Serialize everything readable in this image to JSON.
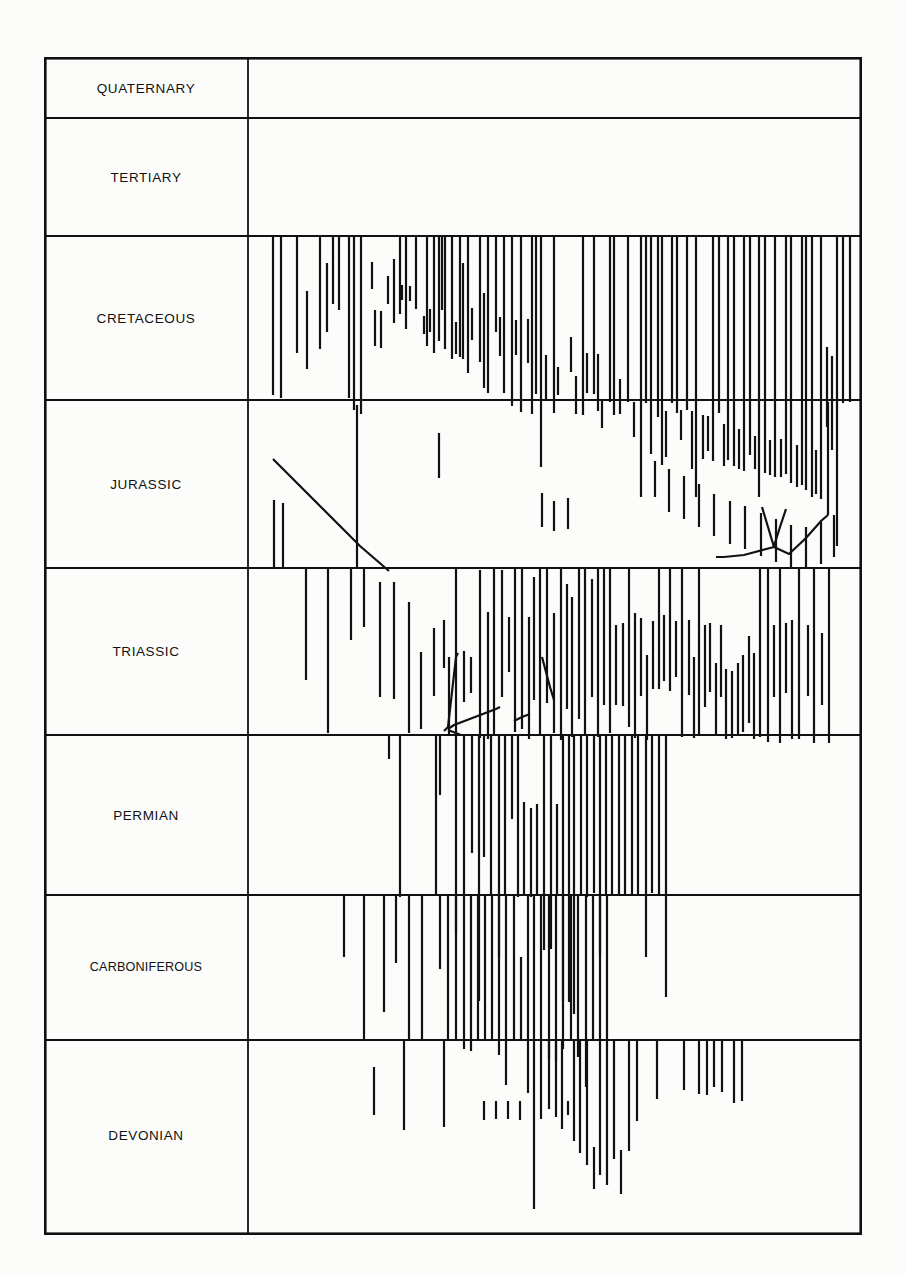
{
  "document": {
    "kind": "stratigraphic-range-chart",
    "orientation": "time-down"
  },
  "frame": {
    "x": 44,
    "y": 57,
    "width": 818,
    "height": 1178,
    "label_column_width": 204,
    "border_color": "#111111",
    "border_width": 2.6,
    "rule_width": 1.8,
    "bar_color": "#111111",
    "bar_width": 2.2,
    "background": "#fcfcfb"
  },
  "periods": [
    {
      "name": "QUATERNARY",
      "top": 0,
      "bottom": 61,
      "label_y": 30.5
    },
    {
      "name": "TERTIARY",
      "top": 61,
      "bottom": 179,
      "label_y": 120
    },
    {
      "name": "CRETACEOUS",
      "top": 179,
      "bottom": 343,
      "label_y": 261
    },
    {
      "name": "JURASSIC",
      "top": 343,
      "bottom": 511,
      "label_y": 427
    },
    {
      "name": "TRIASSIC",
      "top": 511,
      "bottom": 678,
      "label_y": 594
    },
    {
      "name": "PERMIAN",
      "top": 678,
      "bottom": 838,
      "label_y": 758
    },
    {
      "name": "CARBONIFEROUS",
      "top": 838,
      "bottom": 983,
      "label_y": 910
    },
    {
      "name": "DEVONIAN",
      "top": 983,
      "bottom": 1178,
      "label_y": 1078
    }
  ],
  "chart_data": {
    "type": "range-bars",
    "title": "",
    "xlabel": "",
    "ylabel": "",
    "axis_note": "vertical axis = geologic period (Quaternary at top, Devonian at bottom); horizontal axis = unlabelled taxon ordering",
    "grid": true,
    "legend": "none",
    "bar_count": 248,
    "bars": [
      [
        229,
        179,
        338
      ],
      [
        237,
        179,
        341
      ],
      [
        253,
        179,
        296
      ],
      [
        263,
        234,
        312
      ],
      [
        276,
        179,
        292
      ],
      [
        283,
        206,
        275
      ],
      [
        289,
        179,
        247
      ],
      [
        295,
        179,
        253
      ],
      [
        305,
        179,
        341
      ],
      [
        310,
        179,
        353
      ],
      [
        317,
        179,
        357
      ],
      [
        328,
        205,
        232
      ],
      [
        331,
        253,
        289
      ],
      [
        337,
        254,
        291
      ],
      [
        344,
        219,
        247
      ],
      [
        350,
        202,
        266
      ],
      [
        356,
        179,
        257
      ],
      [
        358,
        228,
        243
      ],
      [
        362,
        179,
        272
      ],
      [
        366,
        229,
        244
      ],
      [
        372,
        179,
        252
      ],
      [
        380,
        259,
        277
      ],
      [
        383,
        179,
        289
      ],
      [
        386,
        252,
        275
      ],
      [
        390,
        179,
        296
      ],
      [
        395,
        179,
        284
      ],
      [
        398,
        179,
        253
      ],
      [
        401,
        179,
        292
      ],
      [
        408,
        179,
        302
      ],
      [
        412,
        265,
        297
      ],
      [
        416,
        179,
        300
      ],
      [
        419,
        206,
        302
      ],
      [
        424,
        179,
        316
      ],
      [
        428,
        251,
        283
      ],
      [
        436,
        179,
        305
      ],
      [
        440,
        236,
        331
      ],
      [
        444,
        179,
        336
      ],
      [
        452,
        179,
        275
      ],
      [
        456,
        260,
        299
      ],
      [
        460,
        179,
        336
      ],
      [
        468,
        179,
        349
      ],
      [
        472,
        263,
        298
      ],
      [
        477,
        179,
        355
      ],
      [
        484,
        262,
        306
      ],
      [
        488,
        179,
        357
      ],
      [
        492,
        179,
        337
      ],
      [
        497,
        179,
        410
      ],
      [
        502,
        298,
        344
      ],
      [
        510,
        179,
        356
      ],
      [
        514,
        310,
        338
      ],
      [
        527,
        280,
        315
      ],
      [
        532,
        319,
        357
      ],
      [
        539,
        179,
        358
      ],
      [
        543,
        296,
        336
      ],
      [
        550,
        179,
        337
      ],
      [
        554,
        297,
        354
      ],
      [
        558,
        343,
        371
      ],
      [
        566,
        179,
        345
      ],
      [
        570,
        179,
        358
      ],
      [
        576,
        322,
        357
      ],
      [
        584,
        179,
        345
      ],
      [
        590,
        345,
        380
      ],
      [
        597,
        179,
        440
      ],
      [
        602,
        179,
        346
      ],
      [
        607,
        179,
        397
      ],
      [
        614,
        179,
        360
      ],
      [
        618,
        179,
        408
      ],
      [
        622,
        354,
        400
      ],
      [
        628,
        179,
        346
      ],
      [
        633,
        179,
        356
      ],
      [
        637,
        353,
        383
      ],
      [
        643,
        179,
        353
      ],
      [
        648,
        354,
        412
      ],
      [
        652,
        179,
        440
      ],
      [
        659,
        358,
        402
      ],
      [
        664,
        359,
        394
      ],
      [
        669,
        179,
        404
      ],
      [
        675,
        179,
        356
      ],
      [
        680,
        367,
        409
      ],
      [
        684,
        179,
        403
      ],
      [
        690,
        179,
        409
      ],
      [
        695,
        372,
        412
      ],
      [
        700,
        179,
        414
      ],
      [
        706,
        179,
        398
      ],
      [
        711,
        379,
        412
      ],
      [
        715,
        179,
        440
      ],
      [
        721,
        179,
        416
      ],
      [
        726,
        383,
        418
      ],
      [
        731,
        179,
        420
      ],
      [
        737,
        382,
        420
      ],
      [
        742,
        179,
        417
      ],
      [
        747,
        179,
        426
      ],
      [
        753,
        388,
        430
      ],
      [
        758,
        179,
        428
      ],
      [
        762,
        179,
        433
      ],
      [
        768,
        179,
        440
      ],
      [
        772,
        393,
        437
      ],
      [
        777,
        179,
        442
      ],
      [
        783,
        290,
        370
      ],
      [
        788,
        299,
        393
      ],
      [
        793,
        179,
        489
      ],
      [
        799,
        179,
        346
      ],
      [
        806,
        179,
        345
      ],
      [
        611,
        404,
        440
      ],
      [
        625,
        412,
        455
      ],
      [
        640,
        419,
        462
      ],
      [
        655,
        427,
        470
      ],
      [
        670,
        437,
        479
      ],
      [
        686,
        444,
        487
      ],
      [
        701,
        449,
        492
      ],
      [
        717,
        456,
        499
      ],
      [
        732,
        462,
        505
      ],
      [
        747,
        468,
        510
      ],
      [
        762,
        470,
        512
      ],
      [
        777,
        465,
        507
      ],
      [
        790,
        458,
        500
      ],
      [
        498,
        436,
        470
      ],
      [
        510,
        444,
        474
      ],
      [
        524,
        441,
        472
      ],
      [
        230,
        443,
        511
      ],
      [
        239,
        446,
        511
      ],
      [
        313,
        348,
        511
      ],
      [
        395,
        376,
        421
      ],
      [
        262,
        511,
        623
      ],
      [
        284,
        511,
        676
      ],
      [
        307,
        511,
        583
      ],
      [
        320,
        511,
        570
      ],
      [
        336,
        525,
        640
      ],
      [
        350,
        525,
        642
      ],
      [
        365,
        545,
        676
      ],
      [
        377,
        595,
        672
      ],
      [
        390,
        571,
        639
      ],
      [
        400,
        563,
        611
      ],
      [
        405,
        600,
        678
      ],
      [
        412,
        512,
        678
      ],
      [
        420,
        594,
        645
      ],
      [
        427,
        600,
        636
      ],
      [
        436,
        513,
        681
      ],
      [
        444,
        555,
        682
      ],
      [
        450,
        512,
        678
      ],
      [
        458,
        513,
        640
      ],
      [
        465,
        560,
        615
      ],
      [
        471,
        512,
        675
      ],
      [
        478,
        512,
        672
      ],
      [
        485,
        560,
        682
      ],
      [
        490,
        520,
        643
      ],
      [
        496,
        512,
        678
      ],
      [
        503,
        512,
        646
      ],
      [
        510,
        556,
        676
      ],
      [
        517,
        512,
        683
      ],
      [
        523,
        527,
        652
      ],
      [
        528,
        540,
        680
      ],
      [
        535,
        512,
        662
      ],
      [
        541,
        512,
        677
      ],
      [
        548,
        522,
        640
      ],
      [
        554,
        512,
        680
      ],
      [
        560,
        512,
        648
      ],
      [
        566,
        512,
        676
      ],
      [
        572,
        568,
        648
      ],
      [
        579,
        566,
        649
      ],
      [
        585,
        512,
        670
      ],
      [
        591,
        556,
        681
      ],
      [
        597,
        561,
        639
      ],
      [
        603,
        598,
        683
      ],
      [
        609,
        564,
        632
      ],
      [
        615,
        512,
        632
      ],
      [
        620,
        558,
        624
      ],
      [
        626,
        512,
        634
      ],
      [
        632,
        564,
        620
      ],
      [
        638,
        512,
        680
      ],
      [
        645,
        563,
        638
      ],
      [
        650,
        600,
        681
      ],
      [
        655,
        512,
        679
      ],
      [
        661,
        568,
        650
      ],
      [
        666,
        566,
        635
      ],
      [
        672,
        606,
        678
      ],
      [
        677,
        568,
        640
      ],
      [
        682,
        612,
        682
      ],
      [
        688,
        614,
        681
      ],
      [
        694,
        606,
        678
      ],
      [
        699,
        598,
        675
      ],
      [
        705,
        579,
        666
      ],
      [
        710,
        596,
        682
      ],
      [
        716,
        512,
        680
      ],
      [
        724,
        512,
        685
      ],
      [
        730,
        568,
        640
      ],
      [
        736,
        512,
        686
      ],
      [
        742,
        566,
        636
      ],
      [
        748,
        563,
        682
      ],
      [
        755,
        512,
        682
      ],
      [
        764,
        568,
        639
      ],
      [
        770,
        512,
        686
      ],
      [
        778,
        576,
        648
      ],
      [
        785,
        512,
        686
      ],
      [
        345,
        679,
        702
      ],
      [
        356,
        678,
        840
      ],
      [
        392,
        678,
        838
      ],
      [
        396,
        678,
        738
      ],
      [
        412,
        678,
        876
      ],
      [
        420,
        679,
        838
      ],
      [
        428,
        678,
        796
      ],
      [
        435,
        678,
        944
      ],
      [
        440,
        678,
        800
      ],
      [
        447,
        678,
        838
      ],
      [
        455,
        679,
        900
      ],
      [
        461,
        679,
        838
      ],
      [
        468,
        678,
        762
      ],
      [
        474,
        678,
        840
      ],
      [
        480,
        745,
        838
      ],
      [
        487,
        751,
        840
      ],
      [
        493,
        747,
        838
      ],
      [
        500,
        677,
        893
      ],
      [
        507,
        678,
        892
      ],
      [
        513,
        747,
        838
      ],
      [
        519,
        677,
        944
      ],
      [
        525,
        678,
        945
      ],
      [
        530,
        679,
        957
      ],
      [
        537,
        677,
        838
      ],
      [
        543,
        677,
        840
      ],
      [
        550,
        678,
        836
      ],
      [
        556,
        679,
        898
      ],
      [
        562,
        678,
        838
      ],
      [
        568,
        677,
        838
      ],
      [
        575,
        678,
        839
      ],
      [
        581,
        677,
        838
      ],
      [
        588,
        678,
        838
      ],
      [
        594,
        677,
        839
      ],
      [
        602,
        677,
        900
      ],
      [
        608,
        678,
        836
      ],
      [
        615,
        678,
        839
      ],
      [
        622,
        678,
        940
      ],
      [
        300,
        838,
        900
      ],
      [
        320,
        838,
        983
      ],
      [
        340,
        838,
        955
      ],
      [
        352,
        838,
        906
      ],
      [
        365,
        838,
        983
      ],
      [
        378,
        838,
        983
      ],
      [
        396,
        838,
        912
      ],
      [
        404,
        838,
        983
      ],
      [
        412,
        838,
        983
      ],
      [
        420,
        838,
        992
      ],
      [
        427,
        838,
        994
      ],
      [
        434,
        838,
        983
      ],
      [
        441,
        838,
        983
      ],
      [
        448,
        838,
        983
      ],
      [
        455,
        838,
        998
      ],
      [
        462,
        838,
        1028
      ],
      [
        470,
        838,
        983
      ],
      [
        477,
        900,
        983
      ],
      [
        484,
        838,
        1036
      ],
      [
        490,
        838,
        983
      ],
      [
        497,
        838,
        1062
      ],
      [
        505,
        838,
        1002
      ],
      [
        512,
        838,
        1004
      ],
      [
        519,
        838,
        992
      ],
      [
        527,
        838,
        983
      ],
      [
        534,
        838,
        1000
      ],
      [
        542,
        838,
        1030
      ],
      [
        549,
        838,
        983
      ],
      [
        556,
        838,
        983
      ],
      [
        563,
        838,
        983
      ],
      [
        330,
        1010,
        1058
      ],
      [
        360,
        983,
        1073
      ],
      [
        400,
        983,
        1070
      ],
      [
        440,
        1044,
        1063
      ],
      [
        452,
        1044,
        1062
      ],
      [
        464,
        1044,
        1062
      ],
      [
        476,
        1044,
        1063
      ],
      [
        490,
        983,
        1152
      ],
      [
        505,
        983,
        1052
      ],
      [
        512,
        983,
        1060
      ],
      [
        518,
        983,
        1072
      ],
      [
        524,
        1044,
        1058
      ],
      [
        530,
        983,
        1084
      ],
      [
        536,
        983,
        1096
      ],
      [
        543,
        983,
        1108
      ],
      [
        550,
        1090,
        1132
      ],
      [
        556,
        983,
        1118
      ],
      [
        563,
        983,
        1128
      ],
      [
        570,
        983,
        1102
      ],
      [
        577,
        1093,
        1137
      ],
      [
        585,
        983,
        1094
      ],
      [
        593,
        983,
        1064
      ],
      [
        613,
        983,
        1042
      ],
      [
        640,
        983,
        1033
      ],
      [
        655,
        983,
        1037
      ],
      [
        663,
        983,
        1038
      ],
      [
        670,
        983,
        1030
      ],
      [
        678,
        983,
        1035
      ],
      [
        690,
        983,
        1046
      ],
      [
        698,
        983,
        1044
      ]
    ],
    "connector_polylines": [
      [
        [
          229,
          402
        ],
        [
          239,
          412
        ],
        [
          316,
          489
        ],
        [
          345,
          514
        ]
      ],
      [
        [
          400,
          674
        ],
        [
          404,
          670
        ],
        [
          412,
          600
        ],
        [
          414,
          596
        ]
      ],
      [
        [
          404,
          672
        ],
        [
          410,
          668
        ],
        [
          452,
          652
        ],
        [
          456,
          650
        ]
      ],
      [
        [
          404,
          673
        ],
        [
          417,
          678
        ],
        [
          448,
          678
        ],
        [
          452,
          678
        ]
      ],
      [
        [
          470,
          664
        ],
        [
          478,
          660
        ],
        [
          486,
          657
        ]
      ],
      [
        [
          498,
          600
        ],
        [
          506,
          630
        ],
        [
          510,
          643
        ]
      ],
      [
        [
          718,
          450
        ],
        [
          724,
          470
        ],
        [
          730,
          490
        ]
      ],
      [
        [
          742,
          452
        ],
        [
          736,
          470
        ],
        [
          730,
          489
        ]
      ],
      [
        [
          730,
          490
        ],
        [
          745,
          497
        ],
        [
          762,
          481
        ],
        [
          777,
          464
        ],
        [
          784,
          458
        ]
      ],
      [
        [
          784,
          458
        ],
        [
          784,
          392
        ],
        [
          784,
          345
        ]
      ],
      [
        [
          730,
          490
        ],
        [
          700,
          498
        ],
        [
          680,
          500
        ],
        [
          672,
          500
        ]
      ]
    ]
  }
}
